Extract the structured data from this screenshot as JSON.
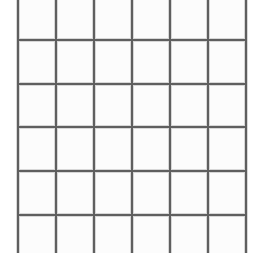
{
  "page": {
    "width": 265,
    "height": 253,
    "background_color": "#ffffff"
  },
  "grid": {
    "name": "blank-grid",
    "description": "Empty hand-drawn style grid of blank cells, cropped at top and bottom edges",
    "line_color": "#5f5f5f",
    "line_halo_color": "#b9b9b9",
    "cell_fill_color": "#fcfcfc",
    "line_width": 2,
    "columns": 6,
    "rows": 4,
    "vertical_line_positions": [
      18,
      56,
      94,
      132,
      170,
      208,
      246
    ],
    "horizontal_line_positions": [
      40,
      84,
      127,
      171,
      215
    ],
    "vertical_extent": [
      0,
      253
    ],
    "horizontal_extent": [
      18,
      246
    ],
    "cropped_top": true,
    "cropped_bottom": true,
    "column_width": 38,
    "row_height": 43.7,
    "cells": [
      [
        "",
        "",
        "",
        "",
        "",
        ""
      ],
      [
        "",
        "",
        "",
        "",
        "",
        ""
      ],
      [
        "",
        "",
        "",
        "",
        "",
        ""
      ],
      [
        "",
        "",
        "",
        "",
        "",
        ""
      ],
      [
        "",
        "",
        "",
        "",
        "",
        ""
      ],
      [
        "",
        "",
        "",
        "",
        "",
        ""
      ]
    ]
  }
}
